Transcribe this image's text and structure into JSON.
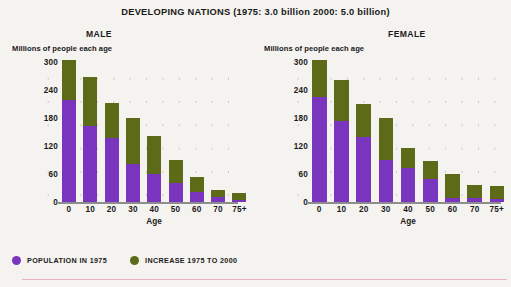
{
  "header": {
    "title": "DEVELOPING NATIONS (1975: 3.0 billion   2000: 5.0 billion)"
  },
  "panels": [
    {
      "name": "male",
      "title": "MALE",
      "y_caption": "Millions of people each age",
      "x_label": "Age"
    },
    {
      "name": "female",
      "title": "FEMALE",
      "y_caption": "Millions of people each age",
      "x_label": "Age"
    }
  ],
  "legend": {
    "items": [
      {
        "label": "POPULATION IN 1975",
        "color": "#7a35bf",
        "icon": "circle-swatch-icon"
      },
      {
        "label": "INCREASE 1975 TO 2000",
        "color": "#5d6a17",
        "icon": "circle-swatch-icon"
      }
    ]
  },
  "colors": {
    "population_1975": "#7a35bf",
    "increase_1975_2000": "#5d6a17",
    "background": "#f5f3f0",
    "axis": "#8d8d8d",
    "rule": "#eeafc0"
  },
  "chart_data": [
    {
      "type": "bar",
      "stacked": true,
      "title": "MALE",
      "xlabel": "Age",
      "ylabel": "Millions of people each age",
      "categories": [
        "0",
        "10",
        "20",
        "30",
        "40",
        "50",
        "60",
        "70",
        "75+"
      ],
      "yticks": [
        0,
        60,
        120,
        180,
        240,
        300
      ],
      "ylim": [
        0,
        300
      ],
      "grid": "dots",
      "legend_position": "below-figure",
      "series": [
        {
          "name": "POPULATION IN 1975",
          "values": [
            218,
            163,
            137,
            82,
            59,
            40,
            22,
            10,
            5
          ]
        },
        {
          "name": "INCREASE 1975 TO 2000",
          "values": [
            87,
            105,
            75,
            98,
            82,
            49,
            31,
            15,
            14
          ]
        }
      ],
      "totals": [
        305,
        268,
        212,
        180,
        141,
        89,
        53,
        25,
        19
      ]
    },
    {
      "type": "bar",
      "stacked": true,
      "title": "FEMALE",
      "xlabel": "Age",
      "ylabel": "Millions of people each age",
      "categories": [
        "0",
        "10",
        "20",
        "30",
        "40",
        "50",
        "60",
        "70",
        "75+"
      ],
      "yticks": [
        0,
        60,
        120,
        180,
        240,
        300
      ],
      "ylim": [
        0,
        300
      ],
      "grid": "dots",
      "legend_position": "below-figure",
      "series": [
        {
          "name": "POPULATION IN 1975",
          "values": [
            226,
            173,
            139,
            91,
            73,
            49,
            9,
            8,
            6
          ]
        },
        {
          "name": "INCREASE 1975 TO 2000",
          "values": [
            79,
            89,
            72,
            89,
            42,
            39,
            52,
            29,
            28
          ]
        }
      ],
      "totals": [
        305,
        262,
        211,
        180,
        115,
        88,
        61,
        37,
        34
      ]
    }
  ]
}
